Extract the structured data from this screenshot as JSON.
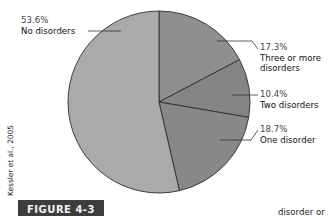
{
  "chart_data": {
    "type": "pie",
    "title": "",
    "figure_label": "FIGURE 4-3",
    "source_credit": "Kessler et al., 2005",
    "start_angle_deg": 0,
    "direction": "clockwise",
    "slices": [
      {
        "label": "Three or more disorders",
        "value": 17.3,
        "display": "17.3%",
        "color": "#8f8f8f"
      },
      {
        "label": "Two disorders",
        "value": 10.4,
        "display": "10.4%",
        "color": "#858585"
      },
      {
        "label": "One disorder",
        "value": 18.7,
        "display": "18.7%",
        "color": "#888888"
      },
      {
        "label": "No disorders",
        "value": 53.6,
        "display": "53.6%",
        "color": "#aaaaaa"
      }
    ],
    "categories": [
      "Three or more disorders",
      "Two disorders",
      "One disorder",
      "No disorders"
    ],
    "values": [
      17.3,
      10.4,
      18.7,
      53.6
    ],
    "legend": "none (direct labels)"
  },
  "labels": {
    "no": {
      "pct": "53.6%",
      "line1": "No disorders"
    },
    "three": {
      "pct": "17.3%",
      "line1": "Three or more",
      "line2": "disorders"
    },
    "two": {
      "pct": "10.4%",
      "line1": "Two disorders"
    },
    "one": {
      "pct": "18.7%",
      "line1": "One disorder"
    }
  },
  "figure": {
    "tag": "FIGURE 4-3",
    "credit": "Kessler et al., 2005",
    "cropped_text": "disorder or"
  }
}
